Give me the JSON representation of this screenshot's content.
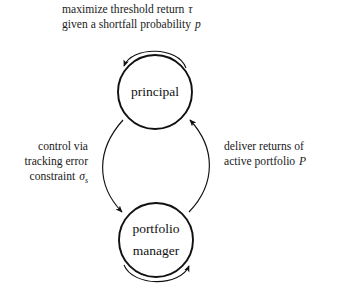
{
  "diagram": {
    "title_lines": [
      "maximize threshold return τ",
      "given a shortfall probability p"
    ],
    "nodes": [
      {
        "id": "principal",
        "label": "principal",
        "label_lines": [
          "principal"
        ],
        "cx": 155,
        "cy": 92,
        "r": 37
      },
      {
        "id": "portfolio-manager",
        "label": "portfolio manager",
        "label_lines": [
          "portfolio",
          "manager"
        ],
        "cx": 156,
        "cy": 240,
        "r": 37
      }
    ],
    "edges": [
      {
        "id": "control-edge",
        "from": "principal",
        "to": "portfolio-manager",
        "side": "left",
        "label_lines": [
          "control via",
          "tracking error",
          "constraint σₛ"
        ],
        "label_plain": "control via tracking error constraint σs"
      },
      {
        "id": "deliver-edge",
        "from": "portfolio-manager",
        "to": "principal",
        "side": "right",
        "label_lines": [
          "deliver returns of",
          "active portfolio P"
        ],
        "label_plain": "deliver returns of active portfolio P"
      },
      {
        "id": "principal-self-loop",
        "from": "principal",
        "to": "principal",
        "side": "top",
        "label_lines": [],
        "label_plain": ""
      },
      {
        "id": "manager-self-loop",
        "from": "portfolio-manager",
        "to": "portfolio-manager",
        "side": "bottom",
        "label_lines": [],
        "label_plain": ""
      }
    ],
    "symbols": {
      "tau": "τ",
      "p": "p",
      "sigma_s": "σₛ",
      "P": "P"
    },
    "colors": {
      "background": "#ffffff",
      "stroke": "#111111",
      "text": "#1a1a1a"
    }
  },
  "labels": {
    "caption_line1_prefix": "maximize threshold return ",
    "caption_line1_math": "τ",
    "caption_line2_prefix": "given a shortfall probability ",
    "caption_line2_math": "p",
    "left_line1": "control via",
    "left_line2": "tracking error",
    "left_line3_prefix": "constraint ",
    "left_line3_math": "σ",
    "left_line3_sub": "s",
    "right_line1": "deliver returns of",
    "right_line2_prefix": "active portfolio ",
    "right_line2_math": "P",
    "node_top": "principal",
    "node_bottom_line1": "portfolio",
    "node_bottom_line2": "manager"
  }
}
